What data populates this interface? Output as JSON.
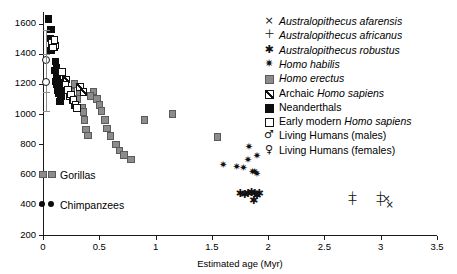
{
  "chart_data": {
    "type": "scatter",
    "title": "",
    "xlabel": "Estimated age (Myr)",
    "ylabel": "",
    "xlim": [
      0,
      3.5
    ],
    "ylim": [
      200,
      1700
    ],
    "xticks": [
      "0",
      "0.5",
      "1",
      "1.5",
      "2",
      "2.5",
      "3",
      "3.5"
    ],
    "xtick_values": [
      0,
      0.5,
      1,
      1.5,
      2,
      2.5,
      3,
      3.5
    ],
    "yticks": [
      "200",
      "400",
      "600",
      "800",
      "1000",
      "1200",
      "1400",
      "1600"
    ],
    "ytick_values": [
      200,
      400,
      600,
      800,
      1000,
      1200,
      1400,
      1600
    ],
    "grid": false,
    "legend_position": "top-right",
    "series": [
      {
        "name": "Australopithecus afarensis",
        "marker": "cross-x",
        "points": [
          [
            3.05,
            430
          ],
          [
            3.08,
            390
          ]
        ]
      },
      {
        "name": "Australopithecus africanus",
        "marker": "plus",
        "points": [
          [
            2.75,
            445
          ],
          [
            2.75,
            415
          ],
          [
            3.0,
            445
          ],
          [
            3.0,
            408
          ]
        ]
      },
      {
        "name": "Australopithecus robustus",
        "marker": "asterisk",
        "points": [
          [
            1.75,
            470
          ],
          [
            1.79,
            462
          ],
          [
            1.82,
            470
          ],
          [
            1.85,
            472
          ],
          [
            1.88,
            468
          ],
          [
            1.9,
            455
          ],
          [
            1.92,
            470
          ],
          [
            1.87,
            420
          ]
        ]
      },
      {
        "name": "Homo habilis",
        "marker": "filled-star-square",
        "points": [
          [
            1.6,
            660
          ],
          [
            1.78,
            640
          ],
          [
            1.82,
            690
          ],
          [
            1.86,
            612
          ],
          [
            1.88,
            608
          ],
          [
            1.9,
            600
          ],
          [
            1.83,
            775
          ],
          [
            1.9,
            718
          ],
          [
            1.72,
            645
          ]
        ]
      },
      {
        "name": "Homo erectus",
        "marker": "gray-square",
        "points": [
          [
            0.25,
            1150
          ],
          [
            0.3,
            1100
          ],
          [
            0.33,
            1145
          ],
          [
            0.35,
            1040
          ],
          [
            0.36,
            1015
          ],
          [
            0.37,
            960
          ],
          [
            0.38,
            900
          ],
          [
            0.4,
            860
          ],
          [
            0.45,
            1150
          ],
          [
            0.48,
            1100
          ],
          [
            0.5,
            1060
          ],
          [
            0.52,
            1020
          ],
          [
            0.55,
            960
          ],
          [
            0.57,
            905
          ],
          [
            0.6,
            855
          ],
          [
            0.65,
            800
          ],
          [
            0.68,
            760
          ],
          [
            0.72,
            730
          ],
          [
            0.78,
            700
          ],
          [
            0.9,
            960
          ],
          [
            1.15,
            1000
          ],
          [
            1.55,
            850
          ],
          [
            0.28,
            1200
          ],
          [
            0.42,
            1120
          ]
        ]
      },
      {
        "name": "Archaic Homo sapiens",
        "marker": "hatched-square",
        "points": [
          [
            0.12,
            1300
          ],
          [
            0.15,
            1260
          ],
          [
            0.17,
            1220
          ],
          [
            0.19,
            1200
          ],
          [
            0.2,
            1180
          ],
          [
            0.22,
            1160
          ],
          [
            0.24,
            1120
          ],
          [
            0.26,
            1090
          ],
          [
            0.28,
            1060
          ],
          [
            0.3,
            1040
          ],
          [
            0.33,
            1180
          ],
          [
            0.36,
            1145
          ],
          [
            0.14,
            1240
          ],
          [
            0.21,
            1230
          ]
        ]
      },
      {
        "name": "Neanderthals",
        "marker": "black-square",
        "points": [
          [
            0.05,
            1630
          ],
          [
            0.07,
            1560
          ],
          [
            0.06,
            1500
          ],
          [
            0.08,
            1480
          ],
          [
            0.09,
            1460
          ],
          [
            0.1,
            1440
          ],
          [
            0.07,
            1420
          ],
          [
            0.11,
            1350
          ],
          [
            0.1,
            1290
          ],
          [
            0.12,
            1250
          ],
          [
            0.13,
            1230
          ],
          [
            0.11,
            1215
          ],
          [
            0.12,
            1200
          ],
          [
            0.14,
            1190
          ],
          [
            0.15,
            1170
          ],
          [
            0.13,
            1155
          ],
          [
            0.14,
            1140
          ],
          [
            0.16,
            1120
          ],
          [
            0.12,
            1310
          ],
          [
            0.15,
            1085
          ]
        ]
      },
      {
        "name": "Early modern Homo sapiens",
        "marker": "open-square",
        "points": [
          [
            0.08,
            1470
          ],
          [
            0.11,
            1455
          ],
          [
            0.09,
            1440
          ],
          [
            0.1,
            1490
          ],
          [
            0.17,
            1280
          ],
          [
            0.2,
            1195
          ],
          [
            0.22,
            1160
          ],
          [
            0.25,
            1130
          ],
          [
            0.27,
            1095
          ],
          [
            0.29,
            1060
          ],
          [
            0.3,
            1040
          ]
        ]
      },
      {
        "name": "Living Humans (males)",
        "marker": "open-circle-errorbar",
        "points": [
          [
            0.03,
            1360
          ]
        ],
        "error": [
          [
            0.03,
            1360,
            1560,
            1145
          ]
        ]
      },
      {
        "name": "Living Humans (females)",
        "marker": "open-circle-errorbar",
        "points": [
          [
            0.03,
            1215
          ]
        ],
        "error": [
          [
            0.03,
            1215,
            1400,
            1020
          ]
        ]
      },
      {
        "name": "Gorillas",
        "marker": "gray-square",
        "points": [
          [
            0.0,
            600
          ]
        ]
      },
      {
        "name": "Chimpanzees",
        "marker": "black-circle",
        "points": [
          [
            0.0,
            400
          ]
        ]
      }
    ]
  },
  "axes": {
    "xlabel": "Estimated age (Myr)",
    "xticks": [
      "0",
      "0.5",
      "1",
      "1.5",
      "2",
      "2.5",
      "3",
      "3.5"
    ],
    "yticks": [
      "1600",
      "1400",
      "1200",
      "1000",
      "800",
      "600",
      "400",
      "200"
    ]
  },
  "legend": {
    "items": [
      {
        "marker": "cross-x-icon",
        "label_pre": "",
        "label_italic": "Australopithecus afarensis",
        "label_post": ""
      },
      {
        "marker": "plus-icon",
        "label_pre": "",
        "label_italic": "Australopithecus africanus",
        "label_post": ""
      },
      {
        "marker": "asterisk-icon",
        "label_pre": "",
        "label_italic": "Australopithecus robustus",
        "label_post": ""
      },
      {
        "marker": "filled-star-square-icon",
        "label_pre": "",
        "label_italic": "Homo habilis",
        "label_post": ""
      },
      {
        "marker": "gray-square-icon",
        "label_pre": "",
        "label_italic": "Homo erectus",
        "label_post": ""
      },
      {
        "marker": "hatched-square-icon",
        "label_pre": "Archaic ",
        "label_italic": "Homo sapiens",
        "label_post": ""
      },
      {
        "marker": "black-square-icon",
        "label_pre": "Neanderthals",
        "label_italic": "",
        "label_post": ""
      },
      {
        "marker": "open-square-icon",
        "label_pre": "Early modern ",
        "label_italic": "Homo sapiens",
        "label_post": ""
      },
      {
        "marker": "male-symbol-icon",
        "label_pre": "Living Humans (males)",
        "label_italic": "",
        "label_post": ""
      },
      {
        "marker": "female-symbol-icon",
        "label_pre": "Living Humans (females)",
        "label_italic": "",
        "label_post": ""
      }
    ]
  },
  "inner_legend": {
    "items": [
      {
        "marker": "gray-square-icon",
        "label": "Gorillas"
      },
      {
        "marker": "black-circle-icon",
        "label": "Chimpanzees"
      }
    ]
  }
}
